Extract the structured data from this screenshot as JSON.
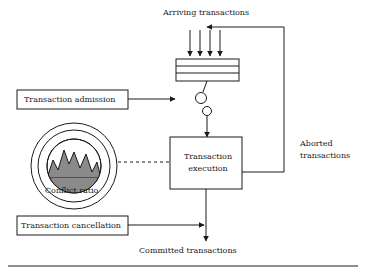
{
  "diagram": {
    "labels": {
      "arriving": "Arriving transactions",
      "admission": "Transaction admission",
      "cancellation": "Transaction cancellation",
      "conflict_ratio": "Conflict ratio",
      "execution_line1": "Transaction",
      "execution_line2": "execution",
      "aborted_line1": "Aborted",
      "aborted_line2": "transactions",
      "committed": "Committed transactions"
    },
    "colors": {
      "stroke": "#1a1a1a",
      "fill_box": "#ffffff",
      "gauge_fill": "#8a8a8a",
      "background": "#ffffff"
    }
  }
}
